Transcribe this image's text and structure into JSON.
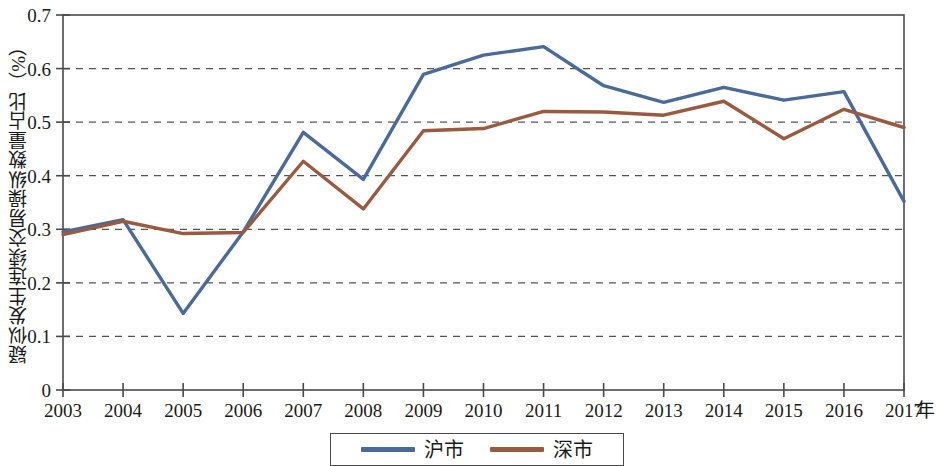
{
  "chart_data": {
    "type": "line",
    "title": "",
    "xlabel": "年",
    "ylabel": "疑似发生连续交易操纵数量占比（%）",
    "x": [
      "2003",
      "2004",
      "2005",
      "2006",
      "2007",
      "2008",
      "2009",
      "2010",
      "2011",
      "2012",
      "2013",
      "2014",
      "2015",
      "2016",
      "2017"
    ],
    "categories": [
      "2003",
      "2004",
      "2005",
      "2006",
      "2007",
      "2008",
      "2009",
      "2010",
      "2011",
      "2012",
      "2013",
      "2014",
      "2015",
      "2016",
      "2017"
    ],
    "xlim": [
      2003,
      2017
    ],
    "ylim": [
      0,
      0.7
    ],
    "yticks": [
      "0",
      "0.1",
      "0.2",
      "0.3",
      "0.4",
      "0.5",
      "0.6",
      "0.7"
    ],
    "ytick_values": [
      0,
      0.1,
      0.2,
      0.3,
      0.4,
      0.5,
      0.6,
      0.7
    ],
    "grid": "horizontal-dashed",
    "legend_position": "bottom-center",
    "series": [
      {
        "name": "沪市",
        "color": "#4a6a9a",
        "values": [
          0.295,
          0.318,
          0.143,
          0.295,
          0.481,
          0.393,
          0.589,
          0.625,
          0.641,
          0.568,
          0.537,
          0.565,
          0.541,
          0.557,
          0.352
        ]
      },
      {
        "name": "深市",
        "color": "#9a5a3f",
        "values": [
          0.29,
          0.315,
          0.292,
          0.294,
          0.427,
          0.338,
          0.484,
          0.488,
          0.52,
          0.519,
          0.513,
          0.539,
          0.469,
          0.524,
          0.49
        ]
      }
    ]
  },
  "legend": {
    "items": [
      {
        "label": "沪市",
        "color": "#4a6a9a"
      },
      {
        "label": "深市",
        "color": "#9a5a3f"
      }
    ]
  },
  "axes": {
    "y_title": "疑似发生连续交易操纵数量占比（%）",
    "x_unit": "年"
  }
}
